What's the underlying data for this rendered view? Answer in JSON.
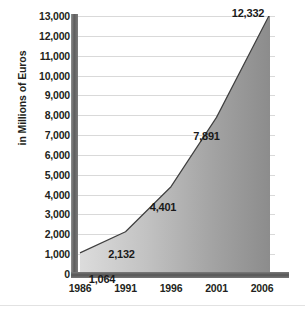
{
  "chart_data": {
    "type": "area",
    "title": "",
    "xlabel": "",
    "ylabel": "in Millions of Euros",
    "categories": [
      "1986",
      "1991",
      "1996",
      "2001",
      "2006"
    ],
    "x": [
      1986,
      1991,
      1996,
      2001,
      2006
    ],
    "values": [
      1064,
      2132,
      4401,
      7891,
      12332
    ],
    "data_labels": [
      "1,064",
      "2,132",
      "4,401",
      "7,891",
      "12,332"
    ],
    "ylim": [
      0,
      13000
    ],
    "ytick_step": 1000,
    "ytick_labels": [
      "13,000",
      "12,000",
      "11,000",
      "10,000",
      "9,000",
      "8,000",
      "7,000",
      "6,000",
      "5,000",
      "4,000",
      "3,000",
      "2,000",
      "1,000",
      "0"
    ],
    "ytick_values": [
      13000,
      12000,
      11000,
      10000,
      9000,
      8000,
      7000,
      6000,
      5000,
      4000,
      3000,
      2000,
      1000,
      0
    ],
    "grid": true,
    "legend": "none",
    "series": [
      {
        "name": "in Millions of Euros",
        "values": [
          1064,
          2132,
          4401,
          7891,
          12332
        ]
      }
    ],
    "colors": {
      "area_fill_light": "#d2d2d2",
      "area_fill_dark": "#8a8a8a",
      "area_outline": "#3f3f3f",
      "gridline": "#d9d9d9",
      "axis_bar": "#5d5d5d",
      "text": "#231f20",
      "background": "#ffffff"
    }
  }
}
